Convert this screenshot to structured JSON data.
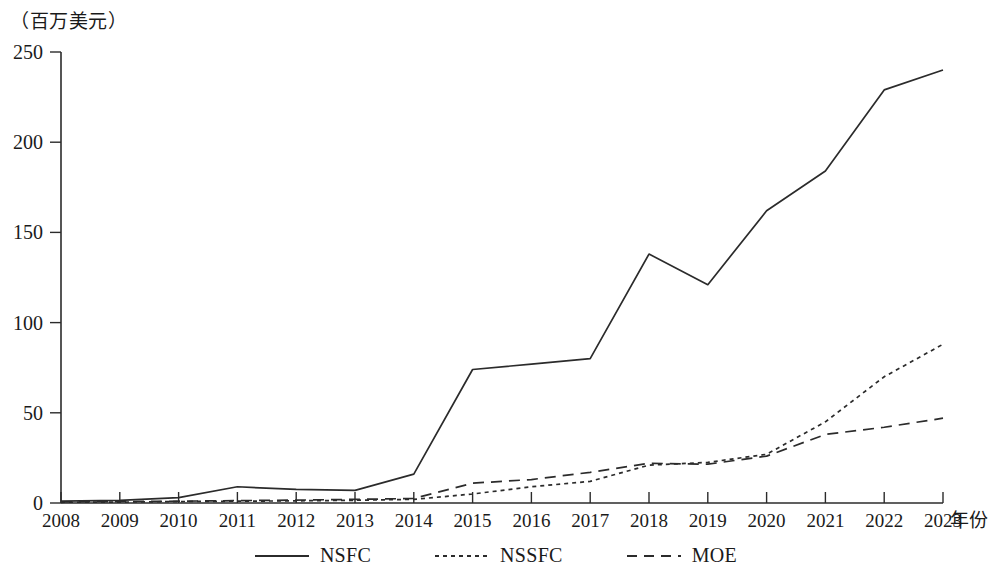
{
  "chart_data": {
    "type": "line",
    "title": "",
    "subtitle": "",
    "unit_label": "（百万美元）",
    "xlabel": "年份",
    "ylabel": "",
    "grid": false,
    "legend_position": "bottom",
    "x": [
      2008,
      2009,
      2010,
      2011,
      2012,
      2013,
      2014,
      2015,
      2016,
      2017,
      2018,
      2019,
      2020,
      2021,
      2022,
      2023
    ],
    "categories": [
      "2008",
      "2009",
      "2010",
      "2011",
      "2012",
      "2013",
      "2014",
      "2015",
      "2016",
      "2017",
      "2018",
      "2019",
      "2020",
      "2021",
      "2022",
      "2023"
    ],
    "xlim": [
      2008,
      2023
    ],
    "ylim": [
      0,
      250
    ],
    "yticks": [
      0,
      50,
      100,
      150,
      200,
      250
    ],
    "ytick_labels": [
      "0",
      "50",
      "100",
      "150",
      "200",
      "250"
    ],
    "series": [
      {
        "name": "NSFC",
        "style": "solid",
        "color": "#2b2b2b",
        "values": [
          1.0,
          1.5,
          3.0,
          9.0,
          7.5,
          7.0,
          16.0,
          74.0,
          77.0,
          80.0,
          138.0,
          121.0,
          162.0,
          184.0,
          229.0,
          240.0
        ]
      },
      {
        "name": "NSSFC",
        "style": "dotted",
        "color": "#2b2b2b",
        "values": [
          0.4,
          0.5,
          0.8,
          1.0,
          1.2,
          1.5,
          2.0,
          5.0,
          9.0,
          12.0,
          21.0,
          22.5,
          27.0,
          45.0,
          70.0,
          88.0
        ]
      },
      {
        "name": "MOE",
        "style": "dashed",
        "color": "#2b2b2b",
        "values": [
          0.6,
          0.8,
          1.0,
          1.3,
          1.6,
          2.0,
          2.5,
          11.0,
          13.0,
          17.0,
          22.0,
          21.5,
          26.0,
          38.0,
          42.0,
          47.0
        ]
      }
    ]
  },
  "legend": {
    "items": [
      {
        "label": "NSFC",
        "style": "solid"
      },
      {
        "label": "NSSFC",
        "style": "dotted"
      },
      {
        "label": "MOE",
        "style": "dashed"
      }
    ]
  }
}
